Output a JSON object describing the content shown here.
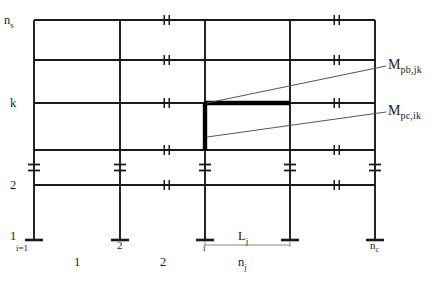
{
  "figure": {
    "line_color": "#1a1a1a",
    "highlight_color": "#000000",
    "leader_color": "#555555"
  },
  "geometry": {
    "column_x": [
      34,
      120,
      205,
      290,
      375
    ],
    "floor_y": [
      20,
      60,
      103,
      150,
      185
    ],
    "base_y": 240,
    "highlight_beam": {
      "x1": 205,
      "x2": 290,
      "y": 103
    },
    "highlight_column": {
      "x": 205,
      "y1": 103,
      "y2": 150
    }
  },
  "story_labels": [
    {
      "text": "n",
      "sub": "s",
      "x": 4,
      "y": 14
    },
    {
      "text": "k",
      "sub": "",
      "x": 10,
      "y": 97
    },
    {
      "text": "2",
      "sub": "",
      "x": 10,
      "y": 179
    },
    {
      "text": "1",
      "sub": "",
      "x": 10,
      "y": 230
    }
  ],
  "column_index_labels": [
    {
      "text": "i=1",
      "x": 16,
      "y": 244
    },
    {
      "text": "2",
      "sub": "",
      "x": 117,
      "y": 240
    },
    {
      "text": "i",
      "sub": "",
      "x": 203,
      "y": 244
    },
    {
      "text": "n",
      "sub": "c",
      "x": 370,
      "y": 240
    }
  ],
  "bay_labels": [
    {
      "text": "1",
      "x": 74,
      "y": 256
    },
    {
      "text": "2",
      "x": 160,
      "y": 256
    },
    {
      "text": "n",
      "sub": "j",
      "x": 238,
      "y": 256
    }
  ],
  "dimension": {
    "label": "L",
    "sub": "j",
    "label_x": 238,
    "label_y": 230,
    "x1": 205,
    "x2": 290,
    "y": 245
  },
  "moment_annotations": [
    {
      "name": "beam-plastic-moment",
      "label": "M",
      "sub": "pb,jk",
      "label_x": 388,
      "label_y": 58,
      "leader": {
        "x1": 207,
        "y1": 103,
        "x2": 386,
        "y2": 66
      }
    },
    {
      "name": "column-plastic-moment",
      "label": "M",
      "sub": "pc,ik",
      "label_x": 388,
      "label_y": 104,
      "leader": {
        "x1": 207,
        "y1": 137,
        "x2": 386,
        "y2": 112
      }
    }
  ],
  "symbols": {
    "beam_break": "double-tick-break",
    "column_break": "double-bar-break",
    "base_support": "fixed-base"
  }
}
